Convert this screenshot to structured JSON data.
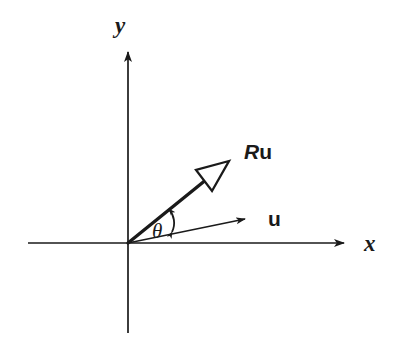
{
  "figure": {
    "kind": "vector-rotation-diagram",
    "background_color": "#ffffff",
    "ink_color": "#1a1a1a",
    "width": 398,
    "height": 337
  },
  "axes": {
    "origin": {
      "x": 128,
      "y": 243
    },
    "x_axis": {
      "label": "x",
      "label_pos": {
        "x": 366,
        "y": 250
      },
      "start": {
        "x": 28,
        "y": 243
      },
      "tip": {
        "x": 350,
        "y": 243
      },
      "arrowhead": "solid-small"
    },
    "y_axis": {
      "label": "y",
      "label_pos": {
        "x": 120,
        "y": 33
      },
      "start": {
        "x": 128,
        "y": 333
      },
      "tip": {
        "x": 128,
        "y": 45
      },
      "arrowhead": "solid-small"
    }
  },
  "vectors": [
    {
      "name": "u",
      "label_parts": [
        {
          "text": "u",
          "style": "upright-bold"
        }
      ],
      "label_pos": {
        "x": 268,
        "y": 225
      },
      "from": {
        "x": 128,
        "y": 243
      },
      "to": {
        "x": 253,
        "y": 218
      },
      "angle_deg": 11,
      "stroke_width": 1.6,
      "arrowhead": "solid-small"
    },
    {
      "name": "Ru",
      "label_parts": [
        {
          "text": "R",
          "style": "italic-bold"
        },
        {
          "text": "u",
          "style": "upright-bold"
        }
      ],
      "label_pos": {
        "x": 244,
        "y": 158
      },
      "from": {
        "x": 128,
        "y": 243
      },
      "to": {
        "x": 228,
        "y": 162
      },
      "angle_deg": 39,
      "stroke_width": 3.4,
      "arrowhead": "hollow-large"
    }
  ],
  "angle_marker": {
    "label": "θ",
    "label_pos": {
      "x": 152,
      "y": 237
    },
    "arc_arrow": {
      "from": {
        "x": 172,
        "y": 231
      },
      "to": {
        "x": 168,
        "y": 209
      },
      "double_headed": true
    }
  }
}
